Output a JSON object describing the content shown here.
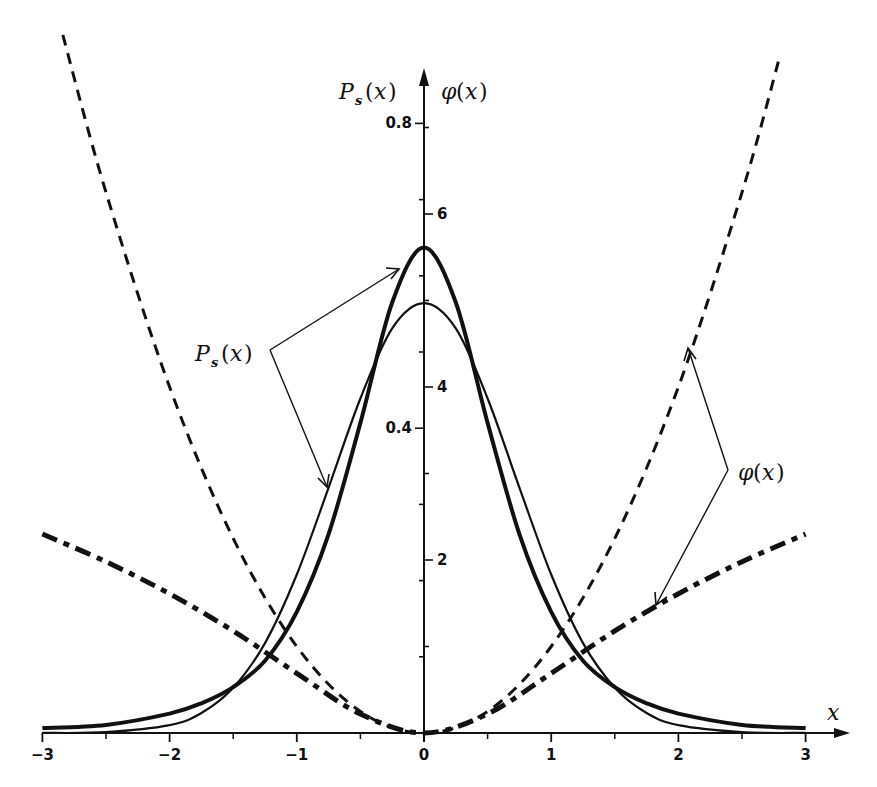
{
  "chart_data": {
    "type": "line",
    "title": "",
    "xlabel": "x",
    "ylabel_left": "P_s(x)",
    "ylabel_right": "φ(x)",
    "xlim": [
      -3,
      3
    ],
    "ylim_left": [
      0,
      0.85
    ],
    "ylim_right": [
      0,
      8.1
    ],
    "grid": false,
    "legend": "none (annotated with arrows)",
    "x_ticks": [
      -3,
      -2,
      -1,
      0,
      1,
      2,
      3
    ],
    "x_tick_labels": [
      "−3",
      "−2",
      "−1",
      "0",
      "1",
      "2",
      "3"
    ],
    "x_minor_ticks": [
      -2.5,
      -1.5,
      -0.5,
      0.5,
      1.5,
      2.5
    ],
    "left_axis_ticks": [
      0.1,
      0.2,
      0.3,
      0.4,
      0.5,
      0.6,
      0.7,
      0.8
    ],
    "left_axis_tick_labels": {
      "0.4": "0.4",
      "0.8": "0.8"
    },
    "right_axis_ticks": [
      1,
      2,
      3,
      4,
      5,
      6,
      7
    ],
    "right_axis_tick_labels": {
      "2": "2",
      "4": "4",
      "6": "6"
    },
    "series": [
      {
        "name": "P_s(x) thick (Lorentzian-squared)",
        "axis": "left",
        "style": "solid-thick",
        "x": [
          -3,
          -2.5,
          -2,
          -1.75,
          -1.5,
          -1.25,
          -1,
          -0.75,
          -0.5,
          -0.25,
          0,
          0.25,
          0.5,
          0.75,
          1,
          1.25,
          1.5,
          1.75,
          2,
          2.5,
          3
        ],
        "values": [
          0.0064,
          0.0106,
          0.0255,
          0.039,
          0.0603,
          0.0949,
          0.159,
          0.261,
          0.407,
          0.565,
          0.637,
          0.565,
          0.407,
          0.261,
          0.159,
          0.0949,
          0.0603,
          0.039,
          0.0255,
          0.0106,
          0.0064
        ]
      },
      {
        "name": "P_s(x) thin (Gaussian)",
        "axis": "left",
        "style": "solid-thin",
        "x": [
          -3,
          -2.5,
          -2,
          -1.75,
          -1.5,
          -1.25,
          -1,
          -0.75,
          -0.5,
          -0.25,
          0,
          0.25,
          0.5,
          0.75,
          1,
          1.25,
          1.5,
          1.75,
          2,
          2.5,
          3
        ],
        "values": [
          0.0001,
          0.0011,
          0.0103,
          0.0262,
          0.0595,
          0.118,
          0.208,
          0.322,
          0.439,
          0.531,
          0.564,
          0.531,
          0.439,
          0.322,
          0.208,
          0.118,
          0.0595,
          0.0262,
          0.0103,
          0.0011,
          0.0001
        ]
      },
      {
        "name": "φ(x) parabola (thin dashed)",
        "axis": "right",
        "style": "dashed-thin",
        "x": [
          -2.84,
          -2.5,
          -2,
          -1.5,
          -1,
          -0.5,
          0,
          0.5,
          1,
          1.5,
          2,
          2.5,
          2.8
        ],
        "values": [
          8.07,
          6.25,
          4.0,
          2.25,
          1.0,
          0.25,
          0,
          0.25,
          1.0,
          2.25,
          4.0,
          6.25,
          7.84
        ]
      },
      {
        "name": "φ(x) logarithmic (thick dash-dot)",
        "axis": "right",
        "style": "dashdot-thick",
        "x": [
          -3,
          -2.5,
          -2,
          -1.5,
          -1,
          -0.5,
          0,
          0.5,
          1,
          1.5,
          2,
          2.5,
          3
        ],
        "values": [
          2.3,
          1.98,
          1.61,
          1.18,
          0.69,
          0.22,
          0,
          0.22,
          0.69,
          1.18,
          1.61,
          1.98,
          2.3
        ]
      }
    ],
    "annotations": [
      {
        "text": "P_s(x)",
        "points_to": [
          "thick P_s peak (left flank near x≈-0.17)",
          "thin P_s left flank near x≈-0.75"
        ]
      },
      {
        "text": "φ(x)",
        "points_to": [
          "parabola near x≈2.06",
          "dash-dot curve near x≈1.82"
        ]
      }
    ]
  },
  "labels": {
    "x_axis": "x",
    "y_left_main": "P",
    "y_left_sub": "s",
    "y_right_main": "φ",
    "paren_open": "(",
    "paren_x": "x",
    "paren_close": ")",
    "annot_ps_main": "P",
    "annot_ps_sub": "s",
    "annot_phi_main": "φ"
  }
}
